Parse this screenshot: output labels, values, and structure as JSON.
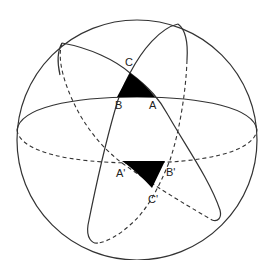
{
  "diagram": {
    "colors": {
      "stroke": "#333333",
      "fill_triangle": "#000000",
      "background": "#ffffff"
    },
    "labels": {
      "A": "A",
      "B": "B",
      "C": "C",
      "A_prime": "A'",
      "B_prime": "B'",
      "C_prime": "C'"
    },
    "elements": [
      {
        "id": "sphere-outline",
        "type": "circle"
      },
      {
        "id": "equator",
        "type": "great-circle",
        "front": "solid",
        "back": "dashed"
      },
      {
        "id": "great-circle-1",
        "type": "great-circle",
        "front": "solid",
        "back": "dashed"
      },
      {
        "id": "great-circle-2",
        "type": "great-circle",
        "front": "solid",
        "back": "dashed"
      },
      {
        "id": "triangle-ABC",
        "type": "filled-spherical-triangle",
        "vertices": [
          "A",
          "B",
          "C"
        ]
      },
      {
        "id": "triangle-A'B'C'",
        "type": "filled-spherical-triangle",
        "vertices": [
          "A'",
          "B'",
          "C'"
        ]
      }
    ]
  }
}
